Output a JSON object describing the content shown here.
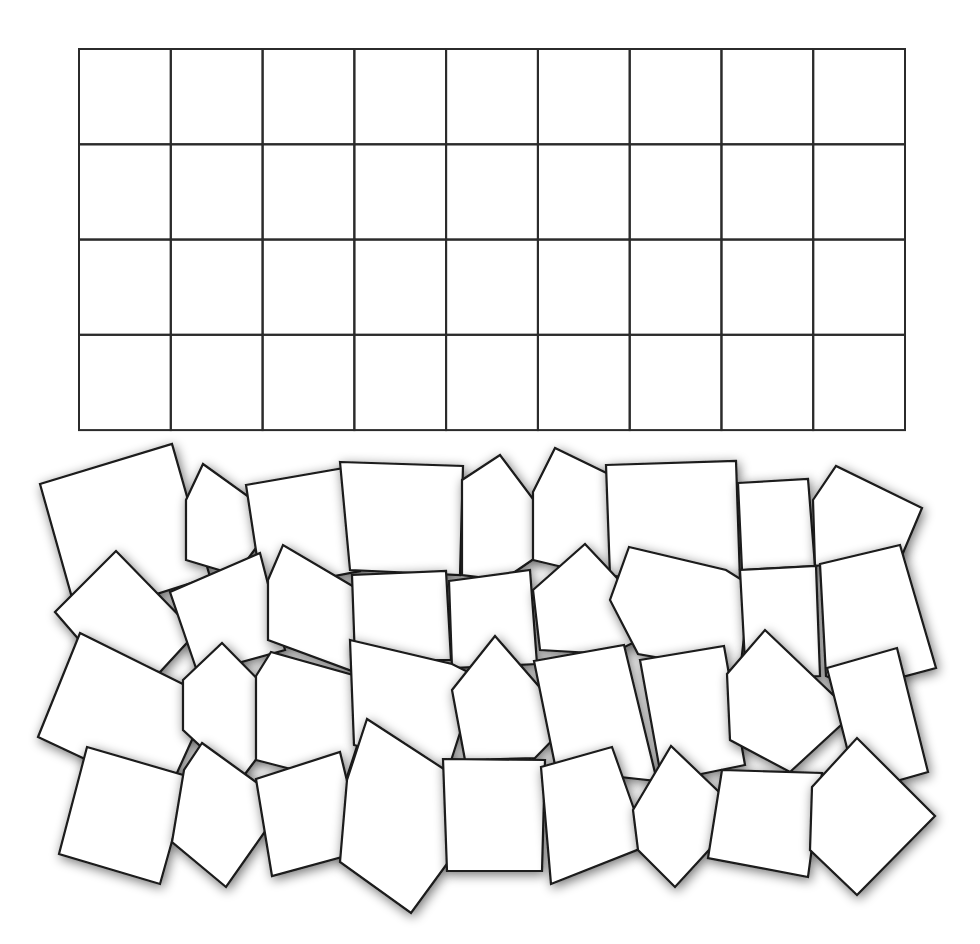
{
  "caption_fragment": {
    "text": "",
    "note": "text line cut off at top edge; only descenders visible"
  },
  "colors": {
    "background": "#ffffff",
    "grid_line": "#2b2b2b",
    "tile_fill": "#ffffff",
    "tile_stroke": "#1a1a1a",
    "shadow": "#000000"
  },
  "grid": {
    "x": 79,
    "y": 49,
    "width": 826,
    "height": 381,
    "columns": 9,
    "rows": 4,
    "stroke_width": 2
  },
  "tiles": [
    {
      "id": 1,
      "points": "40,484 172,444 210,577 78,619"
    },
    {
      "id": 2,
      "points": "186,500 203,464 278,518 236,575 186,560"
    },
    {
      "id": 3,
      "points": "246,485 344,468 360,571 262,590"
    },
    {
      "id": 4,
      "points": "340,462 463,466 460,575 350,570"
    },
    {
      "id": 5,
      "points": "462,480 500,455 563,539 503,580 462,575"
    },
    {
      "id": 6,
      "points": "533,492 555,448 658,498 625,582 533,560"
    },
    {
      "id": 7,
      "points": "606,465 736,461 740,580 610,576"
    },
    {
      "id": 8,
      "points": "738,483 808,479 815,566 742,570"
    },
    {
      "id": 9,
      "points": "813,500 836,466 922,508 903,553 815,566"
    },
    {
      "id": 10,
      "points": "55,612 116,551 196,633 160,672 100,664"
    },
    {
      "id": 11,
      "points": "170,592 260,553 285,650 198,674"
    },
    {
      "id": 12,
      "points": "268,580 283,545 383,604 352,671 268,640"
    },
    {
      "id": 13,
      "points": "352,575 446,571 451,660 355,660"
    },
    {
      "id": 14,
      "points": "449,581 530,570 537,664 452,668"
    },
    {
      "id": 15,
      "points": "533,590 585,544 664,628 610,654 540,650"
    },
    {
      "id": 16,
      "points": "629,547 726,570 750,585 740,672 638,654 610,600"
    },
    {
      "id": 17,
      "points": "740,570 816,566 820,676 746,680"
    },
    {
      "id": 18,
      "points": "820,564 900,545 936,668 857,689 826,676"
    },
    {
      "id": 19,
      "points": "38,737 80,633 211,698 166,797"
    },
    {
      "id": 20,
      "points": "183,680 222,643 291,713 239,782 183,730"
    },
    {
      "id": 21,
      "points": "256,676 271,652 378,682 345,783 256,760"
    },
    {
      "id": 22,
      "points": "350,640 452,664 478,677 448,770 354,745"
    },
    {
      "id": 23,
      "points": "452,690 495,636 570,722 535,758 465,760"
    },
    {
      "id": 24,
      "points": "534,661 624,645 657,781 556,770"
    },
    {
      "id": 25,
      "points": "640,660 724,646 745,765 662,782"
    },
    {
      "id": 26,
      "points": "727,674 765,630 853,714 790,772 730,740"
    },
    {
      "id": 27,
      "points": "827,668 897,648 928,772 858,792"
    },
    {
      "id": 28,
      "points": "87,747 190,777 160,884 59,854"
    },
    {
      "id": 29,
      "points": "202,743 285,803 226,887 172,842 184,770"
    },
    {
      "id": 30,
      "points": "256,779 340,752 364,851 272,876"
    },
    {
      "id": 31,
      "points": "367,719 493,801 411,913 340,862 347,780"
    },
    {
      "id": 32,
      "points": "443,759 545,760 542,871 447,871"
    },
    {
      "id": 33,
      "points": "541,767 612,747 647,846 551,884"
    },
    {
      "id": 34,
      "points": "633,810 671,746 742,814 675,887 638,850"
    },
    {
      "id": 35,
      "points": "722,770 822,773 808,877 708,858"
    },
    {
      "id": 36,
      "points": "812,787 857,738 935,816 857,895 810,850"
    }
  ]
}
